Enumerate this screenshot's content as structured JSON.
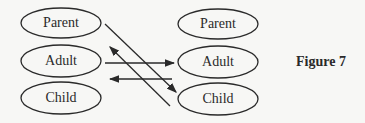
{
  "figure_label": "Figure 7",
  "left_states": [
    {
      "label": "Parent"
    },
    {
      "label": "Adult"
    },
    {
      "label": "Child"
    }
  ],
  "right_states": [
    {
      "label": "Parent"
    },
    {
      "label": "Adult"
    },
    {
      "label": "Child"
    }
  ],
  "transactions": [
    {
      "from": "left.Parent",
      "to": "right.Child"
    },
    {
      "from": "left.Adult",
      "to": "right.Adult"
    },
    {
      "from": "right.Adult",
      "to": "left.Adult"
    },
    {
      "from": "right.Child",
      "to": "left.Adult"
    }
  ],
  "colors": {
    "stroke": "#2a2a2a",
    "background": "#f7f7f5"
  }
}
